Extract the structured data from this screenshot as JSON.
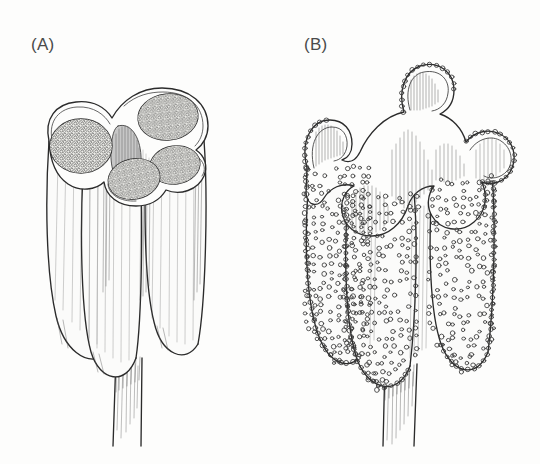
{
  "figure": {
    "kind": "scientific-line-illustration",
    "background_color": "#fdfdfc",
    "ink_color": "#2b2b2b",
    "label_color": "#4a4a4a",
    "width": 540,
    "height": 464
  },
  "panels": [
    {
      "id": "a",
      "label": "(A)",
      "label_x": 31,
      "label_y": 50,
      "caption_state": "undehisced anther cut transversely",
      "locule_count": 4,
      "lobe_count": 3,
      "has_filament": true,
      "pollen_texture": "stippled pollen mass",
      "connective_shading": "dark hatched"
    },
    {
      "id": "b",
      "label": "(B)",
      "label_x": 304,
      "label_y": 50,
      "caption_state": "dehisced anther with recurved walls shedding pollen",
      "locule_count": 4,
      "lobe_count": 3,
      "has_filament": true,
      "pollen_texture": "discrete circular pollen grains",
      "wall_state": "revolute / curled outward"
    }
  ]
}
